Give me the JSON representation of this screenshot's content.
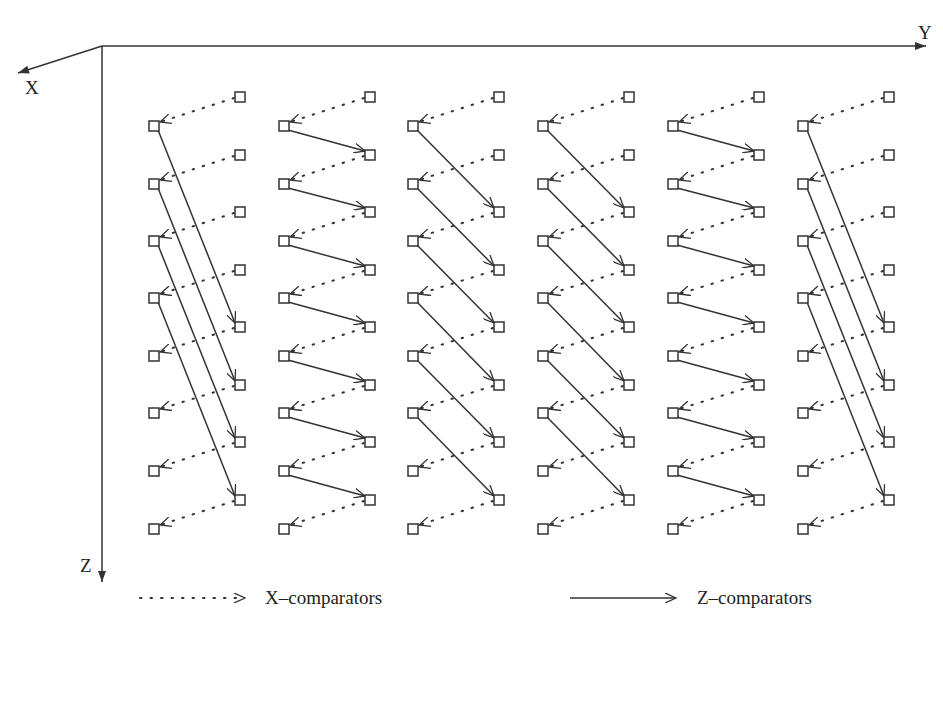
{
  "diagram": {
    "title": "",
    "axes": [
      {
        "name": "X",
        "direction": "out-left"
      },
      {
        "name": "Y",
        "direction": "right"
      },
      {
        "name": "Z",
        "direction": "down"
      }
    ],
    "columns": 6,
    "rows_per_column": 8,
    "node_shape": "square",
    "x_comparators": "dotted arrows from right node to left node, one per row in each column",
    "z_comparators": {
      "column_1": "long arrows from rows 1-4 on left to rows 5-8 on right (offset 4)",
      "column_2": "short arrows from row i on left to row i+1 on right (offset 1)",
      "column_3": "arrows from row i on left to row i+2 on right (offset 2)",
      "column_4": "arrows from row i on left to row i+2 on right (offset 2)",
      "column_5": "short arrows from row i on left to row i+1 on right (offset 1)",
      "column_6": "long arrows from rows 1-4 on left to rows 5-8 on right (offset 4)"
    }
  },
  "labels": {
    "axis_x": "X",
    "axis_y": "Y",
    "axis_z": "Z"
  },
  "legend": {
    "x_comparators": "X–comparators",
    "z_comparators": "Z–comparators"
  },
  "colors": {
    "line": "#333333",
    "background": "#ffffff"
  }
}
